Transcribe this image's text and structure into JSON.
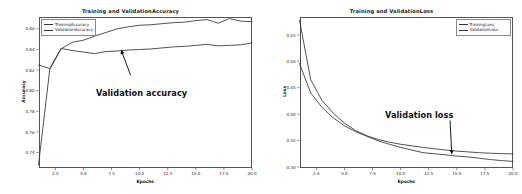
{
  "figure": {
    "background": "#ffffff",
    "width": 522,
    "height": 194
  },
  "chart_data": [
    {
      "type": "line",
      "id": "accuracy",
      "title": "Training and ValidationAccuracy",
      "xlabel": "Epochs",
      "ylabel": "Accuracy",
      "xlim": [
        1,
        20
      ],
      "ylim": [
        0.725,
        0.872
      ],
      "grid": false,
      "legend_position": "upper left",
      "xticks": [
        "2.5",
        "5.0",
        "7.5",
        "10.0",
        "12.5",
        "15.0",
        "17.5",
        "20.0"
      ],
      "xtick_values": [
        2.5,
        5.0,
        7.5,
        10.0,
        12.5,
        15.0,
        17.5,
        20.0
      ],
      "yticks": [
        "0.74",
        "0.76",
        "0.78",
        "0.80",
        "0.82",
        "0.84",
        "0.86"
      ],
      "ytick_values": [
        0.74,
        0.76,
        0.78,
        0.8,
        0.82,
        0.84,
        0.86
      ],
      "x": [
        1,
        2,
        3,
        4,
        5,
        6,
        7,
        8,
        9,
        10,
        11,
        12,
        13,
        14,
        15,
        16,
        17,
        18,
        19,
        20
      ],
      "series": [
        {
          "name": "TrainingAccuracy",
          "color": "#333333",
          "values": [
            0.728,
            0.8205,
            0.8405,
            0.847,
            0.849,
            0.853,
            0.8565,
            0.86,
            0.862,
            0.8635,
            0.864,
            0.865,
            0.866,
            0.8665,
            0.868,
            0.869,
            0.8655,
            0.87,
            0.8675,
            0.867
          ]
        },
        {
          "name": "ValidationAccuracy",
          "color": "#333333",
          "values": [
            0.825,
            0.8215,
            0.841,
            0.839,
            0.8375,
            0.836,
            0.838,
            0.8385,
            0.8395,
            0.84,
            0.8405,
            0.8415,
            0.8425,
            0.843,
            0.844,
            0.845,
            0.8435,
            0.844,
            0.8445,
            0.8465
          ]
        }
      ],
      "annotation": {
        "text": "Validation accuracy",
        "arrow_from": [
          9.2,
          0.815
        ],
        "arrow_to": [
          8.35,
          0.8395
        ]
      }
    },
    {
      "type": "line",
      "id": "loss",
      "title": "Training and ValidationLoss",
      "xlabel": "Epochs",
      "ylabel": "Loss",
      "xlim": [
        1,
        20
      ],
      "ylim": [
        0.298,
        0.585
      ],
      "grid": false,
      "legend_position": "upper right",
      "xticks": [
        "2.5",
        "5.0",
        "7.5",
        "10.0",
        "12.5",
        "15.0",
        "17.5",
        "20.0"
      ],
      "xtick_values": [
        2.5,
        5.0,
        7.5,
        10.0,
        12.5,
        15.0,
        17.5,
        20.0
      ],
      "yticks": [
        "0.30",
        "0.35",
        "0.40",
        "0.45",
        "0.50",
        "0.55"
      ],
      "ytick_values": [
        0.3,
        0.35,
        0.4,
        0.45,
        0.5,
        0.55
      ],
      "x": [
        1,
        2,
        3,
        4,
        5,
        6,
        7,
        8,
        9,
        10,
        11,
        12,
        13,
        14,
        15,
        16,
        17,
        18,
        19,
        20
      ],
      "series": [
        {
          "name": "TrainingLoss",
          "color": "#333333",
          "values": [
            0.578,
            0.465,
            0.426,
            0.402,
            0.383,
            0.369,
            0.359,
            0.352,
            0.347,
            0.343,
            0.34,
            0.337,
            0.3345,
            0.332,
            0.33,
            0.3285,
            0.327,
            0.326,
            0.3252,
            0.3248
          ]
        },
        {
          "name": "ValidationLoss",
          "color": "#333333",
          "values": [
            0.496,
            0.44,
            0.413,
            0.393,
            0.378,
            0.367,
            0.358,
            0.3495,
            0.343,
            0.337,
            0.332,
            0.327,
            0.325,
            0.323,
            0.3205,
            0.319,
            0.3165,
            0.314,
            0.312,
            0.3105
          ]
        }
      ],
      "annotation": {
        "text": "Validation loss",
        "arrow_from": [
          14.4,
          0.388
        ],
        "arrow_to": [
          14.55,
          0.3245
        ]
      }
    }
  ]
}
